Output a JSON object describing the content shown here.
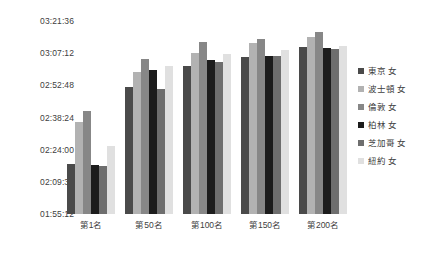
{
  "chart_data": {
    "type": "bar",
    "title": "",
    "subtitle": "",
    "xlabel": "",
    "ylabel": "",
    "categories": [
      "第1名",
      "第50名",
      "第100名",
      "第150名",
      "第200名"
    ],
    "ytick_labels": [
      "01:55:12",
      "02:09:36",
      "02:24:00",
      "02:38:24",
      "02:52:48",
      "03:07:12",
      "03:21:36"
    ],
    "ytick_seconds": [
      6912,
      7776,
      8640,
      9504,
      10368,
      11232,
      12096
    ],
    "ylim_seconds": [
      6912,
      12096
    ],
    "ytick_step": "00:14:24",
    "grid": false,
    "legend_position": "right",
    "series": [
      {
        "name": "東京 女",
        "color": "#4a4a4a",
        "values": [
          "02:17:45",
          "02:52:10",
          "03:01:40",
          "03:05:30",
          "03:09:50"
        ],
        "values_seconds": [
          8265,
          10330,
          10900,
          11130,
          11390
        ]
      },
      {
        "name": "波士頓 女",
        "color": "#b2b2b2",
        "values": [
          "02:36:30",
          "02:58:50",
          "03:07:20",
          "03:11:40",
          "03:14:20"
        ],
        "values_seconds": [
          9390,
          10730,
          11240,
          11500,
          11660
        ]
      },
      {
        "name": "倫敦 女",
        "color": "#878787",
        "values": [
          "02:41:20",
          "03:04:40",
          "03:12:10",
          "03:13:20",
          "03:16:40"
        ],
        "values_seconds": [
          9680,
          11080,
          11530,
          11600,
          11800
        ]
      },
      {
        "name": "柏林 女",
        "color": "#1c1c1c",
        "values": [
          "02:17:10",
          "02:59:30",
          "03:04:20",
          "03:05:50",
          "03:09:30"
        ],
        "values_seconds": [
          8230,
          10770,
          11060,
          11150,
          11370
        ]
      },
      {
        "name": "芝加哥 女",
        "color": "#6e6e6e",
        "values": [
          "02:16:50",
          "02:51:20",
          "03:03:10",
          "03:06:00",
          "03:09:10"
        ],
        "values_seconds": [
          8210,
          10280,
          10990,
          11160,
          11350
        ]
      },
      {
        "name": "紐約 女",
        "color": "#e0e0e0",
        "values": [
          "02:25:40",
          "03:01:20",
          "03:06:50",
          "03:08:40",
          "03:10:30"
        ],
        "values_seconds": [
          8740,
          10880,
          11210,
          11320,
          11430
        ]
      }
    ]
  }
}
